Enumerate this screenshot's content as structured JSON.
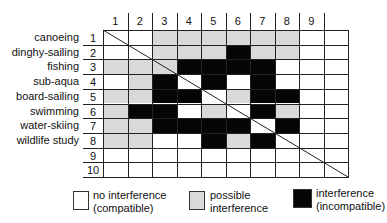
{
  "matrix": {
    "column_headers": [
      "1",
      "2",
      "3",
      "4",
      "5",
      "6",
      "7",
      "8",
      "9",
      ""
    ],
    "rows": [
      {
        "num": "1",
        "label": "canoeing",
        "cells": [
          "W",
          "W",
          "G",
          "G",
          "G",
          "G",
          "G",
          "G",
          "W",
          "W"
        ]
      },
      {
        "num": "2",
        "label": "dinghy-sailing",
        "cells": [
          "W",
          "W",
          "G",
          "G",
          "G",
          "B",
          "G",
          "G",
          "W",
          "W"
        ]
      },
      {
        "num": "3",
        "label": "fishing",
        "cells": [
          "G",
          "G",
          "G",
          "B",
          "B",
          "B",
          "B",
          "W",
          "W",
          "W"
        ]
      },
      {
        "num": "4",
        "label": "sub-aqua",
        "cells": [
          "W",
          "G",
          "B",
          "W",
          "B",
          "W",
          "B",
          "W",
          "W",
          "W"
        ]
      },
      {
        "num": "5",
        "label": "board-sailing",
        "cells": [
          "G",
          "G",
          "B",
          "B",
          "W",
          "G",
          "B",
          "B",
          "W",
          "W"
        ]
      },
      {
        "num": "6",
        "label": "swimming",
        "cells": [
          "G",
          "B",
          "B",
          "W",
          "G",
          "W",
          "B",
          "G",
          "W",
          "W"
        ]
      },
      {
        "num": "7",
        "label": "water-skiing",
        "cells": [
          "G",
          "G",
          "B",
          "B",
          "B",
          "B",
          "W",
          "B",
          "W",
          "W"
        ]
      },
      {
        "num": "8",
        "label": "wildlife study",
        "cells": [
          "G",
          "G",
          "W",
          "W",
          "B",
          "G",
          "B",
          "W",
          "W",
          "W"
        ]
      },
      {
        "num": "9",
        "label": "",
        "cells": [
          "W",
          "W",
          "W",
          "W",
          "W",
          "W",
          "W",
          "W",
          "W",
          "W"
        ]
      },
      {
        "num": "10",
        "label": "",
        "cells": [
          "W",
          "W",
          "W",
          "W",
          "W",
          "W",
          "W",
          "W",
          "W",
          "W"
        ]
      }
    ]
  },
  "legend": [
    {
      "key": "W",
      "line1": "no interference",
      "line2": "(compatible)"
    },
    {
      "key": "G",
      "line1": "possible",
      "line2": "interference"
    },
    {
      "key": "B",
      "line1": "interference",
      "line2": "(incompatible)"
    }
  ],
  "colors": {
    "none": "#ffffff",
    "possible": "#d9d9d9",
    "incompatible": "#050505",
    "grid": "#222222"
  }
}
